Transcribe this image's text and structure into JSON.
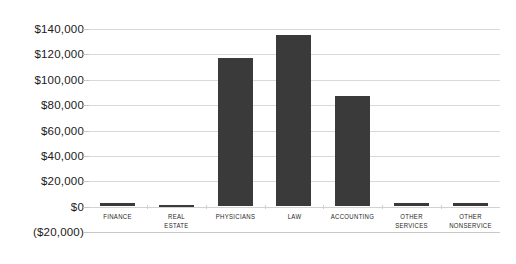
{
  "chart_data": {
    "type": "bar",
    "title": "",
    "subtitle": "",
    "xlabel": "",
    "ylabel": "",
    "categories": [
      "FINANCE",
      "REAL\nESTATE",
      "PHYSICIANS",
      "LAW",
      "ACCOUNTING",
      "OTHER\nSERVICES",
      "OTHER\nNONSERVICE"
    ],
    "values": [
      2500,
      500,
      117000,
      135000,
      87000,
      2500,
      2500
    ],
    "ylim": [
      -20000,
      140000
    ],
    "ytick_values": [
      140000,
      120000,
      100000,
      80000,
      60000,
      40000,
      20000,
      0,
      -20000
    ],
    "ytick_labels": [
      "$140,000",
      "$120,000",
      "$100,000",
      "$80,000",
      "$60,000",
      "$40,000",
      "$20,000",
      "$0",
      "($20,000)"
    ],
    "grid": true,
    "legend": false,
    "legend_position": "none",
    "bar_color": "#3a3a3a",
    "gridline_color": "#d9d9d9",
    "background_color": "#ffffff"
  }
}
